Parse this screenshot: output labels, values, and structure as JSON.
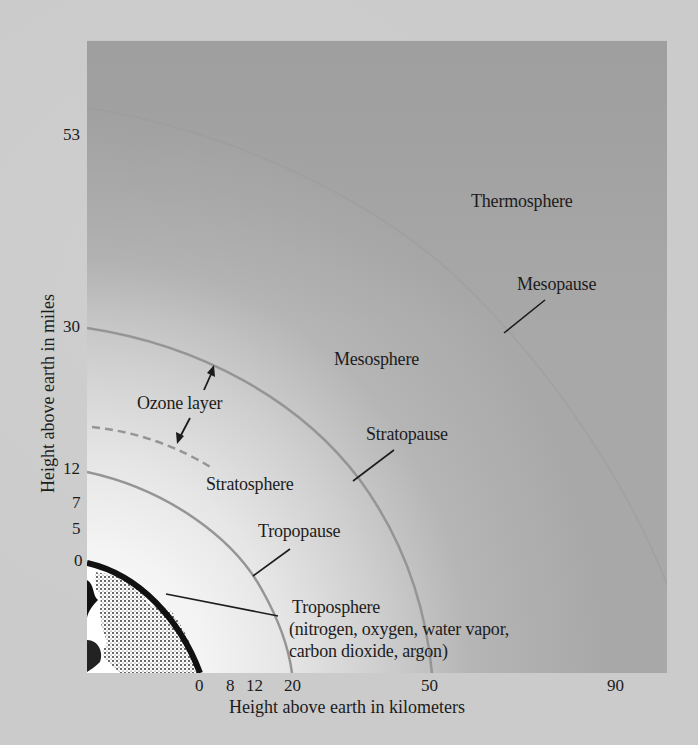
{
  "diagram": {
    "y_axis": {
      "title": "Height above earth in miles",
      "ticks": [
        "53",
        "30",
        "12",
        "7",
        "5",
        "0"
      ]
    },
    "x_axis": {
      "title": "Height above earth in kilometers",
      "ticks": [
        "0",
        "8",
        "12",
        "20",
        "50",
        "90"
      ]
    },
    "layers": {
      "thermosphere": "Thermosphere",
      "mesopause": "Mesopause",
      "mesosphere": "Mesosphere",
      "stratopause": "Stratopause",
      "stratosphere": "Stratosphere",
      "tropopause": "Tropopause",
      "troposphere": "Troposphere",
      "troposphere_gases_line1": "(nitrogen, oxygen, water vapor,",
      "troposphere_gases_line2": "carbon dioxide, argon)",
      "ozone_layer": "Ozone layer"
    },
    "colors": {
      "page_background": "#cbcbcb",
      "panel_dark": "#a8a8a8",
      "panel_light": "#ffffff",
      "boundary_line": "#8e8e8e",
      "text": "#1c1c1c"
    }
  }
}
